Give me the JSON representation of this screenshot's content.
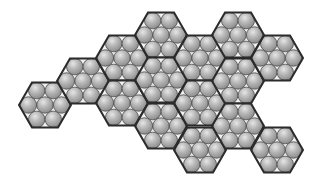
{
  "diagram": {
    "hex_radius": 26,
    "sphere_radius": 8.2,
    "colors": {
      "background": "#ffffff",
      "hex_fill": "#f2f2f2",
      "hex_stroke": "#2b2b2b",
      "sphere_light": "#e6e6e6",
      "sphere_mid": "#b8b8b8",
      "sphere_dark": "#8a8a8a",
      "sphere_stroke": "#4a4a4a"
    },
    "hexagons": [
      {
        "id": "hex-1",
        "cx": 45,
        "cy": 105
      },
      {
        "id": "hex-2",
        "cx": 83,
        "cy": 81
      },
      {
        "id": "hex-3",
        "cx": 122,
        "cy": 58
      },
      {
        "id": "hex-4",
        "cx": 122,
        "cy": 103
      },
      {
        "id": "hex-5",
        "cx": 161,
        "cy": 35
      },
      {
        "id": "hex-6",
        "cx": 161,
        "cy": 80
      },
      {
        "id": "hex-7",
        "cx": 161,
        "cy": 126
      },
      {
        "id": "hex-8",
        "cx": 200,
        "cy": 58
      },
      {
        "id": "hex-9",
        "cx": 200,
        "cy": 103
      },
      {
        "id": "hex-10",
        "cx": 200,
        "cy": 150
      },
      {
        "id": "hex-11",
        "cx": 238,
        "cy": 35
      },
      {
        "id": "hex-12",
        "cx": 238,
        "cy": 81
      },
      {
        "id": "hex-13",
        "cx": 238,
        "cy": 126
      },
      {
        "id": "hex-14",
        "cx": 277,
        "cy": 58
      },
      {
        "id": "hex-15",
        "cx": 277,
        "cy": 150
      }
    ],
    "spheres_per_hex": 7
  }
}
